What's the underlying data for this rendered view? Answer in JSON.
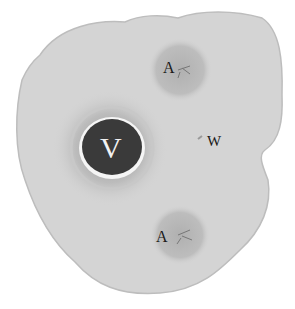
{
  "figure": {
    "colors": {
      "background": "#ffffff",
      "tissue": "#d4d4d4",
      "tissue_edge": "#bdbdbd",
      "artery": "#b5b5b5",
      "vein_lumen": "#3a3a3a",
      "vein_ring": "#f5f5f5"
    },
    "labels": {
      "vein": "V",
      "artery_top": "A",
      "artery_bottom": "A",
      "wharton": "W"
    }
  }
}
